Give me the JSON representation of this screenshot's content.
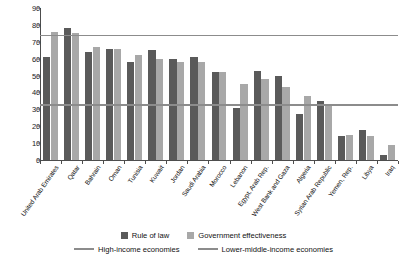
{
  "chart_data": {
    "type": "bar",
    "title": "",
    "subtitle": "",
    "xlabel": "",
    "ylabel": "",
    "ylim": [
      0,
      90
    ],
    "yticks": [
      0,
      10,
      20,
      30,
      40,
      50,
      60,
      70,
      80,
      90
    ],
    "grid": false,
    "legend_position": "bottom",
    "orientation": "vertical",
    "categories": [
      "United Arab Emirates",
      "Qatar",
      "Bahrain",
      "Oman",
      "Tunisia",
      "Kuwait",
      "Jordan",
      "Saudi Arabia",
      "Morocco",
      "Lebanon",
      "Egypt, Arab Rep.",
      "West Bank and Gaza",
      "Algeria",
      "Syrian Arab Republic",
      "Yemen, Rep.",
      "Libya",
      "Iraq"
    ],
    "series": [
      {
        "name": "Rule of law",
        "color": "#5a5a5a",
        "values": [
          61,
          78,
          64,
          66,
          58,
          65,
          60,
          61,
          52,
          31,
          53,
          50,
          27,
          35,
          14,
          18,
          3
        ]
      },
      {
        "name": "Government effectiveness",
        "color": "#a8a8a8",
        "values": [
          76,
          75,
          67,
          66,
          62,
          60,
          58,
          58,
          52,
          45,
          48,
          43,
          38,
          33,
          15,
          14,
          9
        ]
      }
    ],
    "reference_lines": [
      {
        "name": "High-income economies",
        "value": 74,
        "color": "#8c8c8c"
      },
      {
        "name": "Lower-middle-income economies",
        "value": 33,
        "color": "#8c8c8c"
      }
    ]
  }
}
